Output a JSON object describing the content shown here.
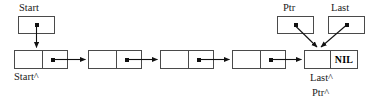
{
  "diagram": {
    "type": "linked-list",
    "colors": {
      "background": "#ffffff",
      "box_border": "#4a4a4a",
      "dot": "#111111",
      "arrow": "#111111",
      "text": "#1a1a1a"
    },
    "pointers": {
      "start": {
        "label": "Start",
        "deref_label": "Start^"
      },
      "ptr": {
        "label": "Ptr",
        "deref_label": "Ptr^"
      },
      "last": {
        "label": "Last",
        "deref_label": "Last^"
      }
    },
    "nodes": [
      {
        "index": 1,
        "data": "",
        "link": "pointer"
      },
      {
        "index": 2,
        "data": "",
        "link": "pointer"
      },
      {
        "index": 3,
        "data": "",
        "link": "pointer"
      },
      {
        "index": 4,
        "data": "",
        "link": "pointer"
      },
      {
        "index": 5,
        "data": "",
        "link": "NIL"
      }
    ],
    "nil_label": "NIL"
  }
}
